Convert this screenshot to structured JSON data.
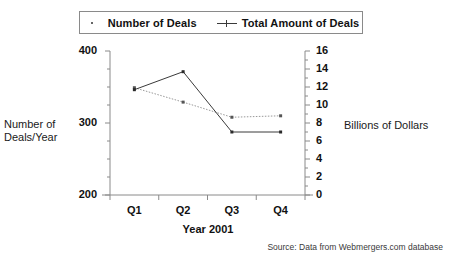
{
  "chart_data": {
    "type": "line",
    "title": "",
    "subtitle": "",
    "xlabel": "Year 2001",
    "categories": [
      "Q1",
      "Q2",
      "Q3",
      "Q4"
    ],
    "grid": false,
    "legend_position": "top",
    "series": [
      {
        "name": "Number of Deals",
        "axis": "left",
        "style": "dotted",
        "marker": "square-dot",
        "color": "#999999",
        "values": [
          349,
          329,
          308,
          310
        ]
      },
      {
        "name": "Total Amount of Deals",
        "axis": "right",
        "style": "solid",
        "marker": "cross",
        "color": "#3a3a3a",
        "values": [
          11.7,
          13.7,
          7.0,
          7.0
        ]
      }
    ],
    "left_axis": {
      "label": "Number of Deals/Year",
      "label_line1": "Number of",
      "label_line2": "Deals/Year",
      "ylim": [
        200,
        400
      ],
      "ticks": [
        200,
        300,
        400
      ],
      "tick_labels": [
        "200",
        "300",
        "400"
      ],
      "minor_tick_step": 25
    },
    "right_axis": {
      "label": "Billions of Dollars",
      "ylim": [
        0,
        16
      ],
      "ticks": [
        0,
        2,
        4,
        6,
        8,
        10,
        12,
        14,
        16
      ],
      "tick_labels": [
        "0",
        "2",
        "4",
        "6",
        "8",
        "10",
        "12",
        "14",
        "16"
      ],
      "minor_tick_step": 1
    },
    "source": "Source: Data from Webmergers.com database"
  },
  "legend": {
    "entries": [
      {
        "label": "Number of Deals",
        "marker_name": "dot-marker-icon"
      },
      {
        "label": "Total Amount of Deals",
        "marker_name": "line-cross-marker-icon"
      }
    ]
  }
}
